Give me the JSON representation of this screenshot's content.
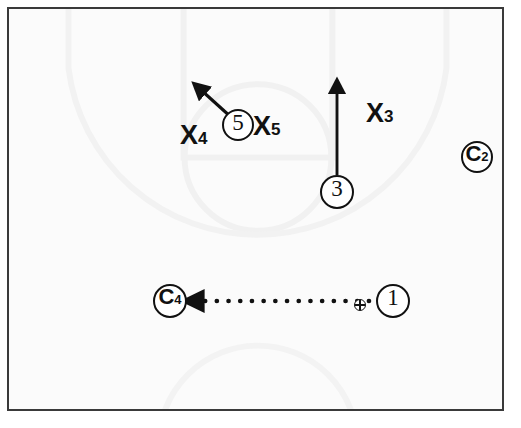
{
  "diagram": {
    "type": "halfcourt-play",
    "background_color": "#fbfbfb",
    "ink_color": "#111111",
    "frame_color": "#3a3a3a",
    "width": 521,
    "height": 428
  },
  "offense": [
    {
      "id": "player-1",
      "label": "1",
      "kind": "offense-circle",
      "x": 393,
      "y": 301,
      "r": 17,
      "has_ball": true
    },
    {
      "id": "player-3",
      "label": "3",
      "kind": "offense-circle",
      "x": 337,
      "y": 192,
      "r": 17,
      "has_ball": false
    },
    {
      "id": "player-5",
      "label": "5",
      "kind": "offense-circle",
      "x": 238,
      "y": 125,
      "r": 16,
      "has_ball": false
    }
  ],
  "defense_circled": [
    {
      "id": "defender-c2",
      "label": "C",
      "subscript": "2",
      "kind": "circled-defender",
      "x": 477,
      "y": 157,
      "r": 16
    },
    {
      "id": "defender-c4",
      "label": "C",
      "subscript": "4",
      "kind": "circled-defender",
      "x": 170,
      "y": 301,
      "r": 17
    }
  ],
  "defense_x": [
    {
      "id": "defender-x3",
      "label": "X",
      "subscript": "3",
      "kind": "x-defender",
      "x": 386,
      "y": 116
    },
    {
      "id": "defender-x4",
      "label": "X",
      "subscript": "4",
      "kind": "x-defender",
      "x": 199,
      "y": 138
    },
    {
      "id": "defender-x5",
      "label": "X",
      "subscript": "5",
      "kind": "x-defender",
      "x": 272,
      "y": 129
    }
  ],
  "movements": [
    {
      "id": "cut-5",
      "style": "solid-arrow",
      "meaning": "player cut",
      "from_x": 232,
      "from_y": 118,
      "to_x": 197,
      "to_y": 86
    },
    {
      "id": "cut-3",
      "style": "solid-arrow",
      "meaning": "player cut",
      "from_x": 337,
      "from_y": 175,
      "to_x": 337,
      "to_y": 84
    }
  ],
  "passes": [
    {
      "id": "pass-1-to-c4",
      "style": "dotted-arrow",
      "meaning": "pass",
      "from_x": 369,
      "from_y": 301,
      "to_x": 192,
      "to_y": 301
    }
  ],
  "ball": {
    "id": "basketball",
    "x": 360,
    "y": 305,
    "size": 12
  },
  "court": {
    "show_markings": true,
    "marking_color": "#f0f0f0",
    "elements": [
      "free-throw-lane",
      "free-throw-circle",
      "three-point-arc",
      "center-circle"
    ]
  }
}
